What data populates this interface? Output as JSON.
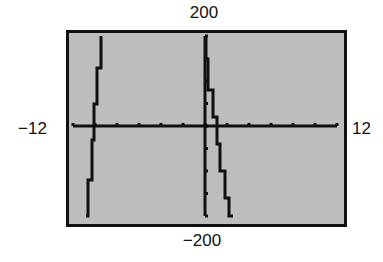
{
  "window": {
    "xmin_label": "−12",
    "xmax_label": "12",
    "ymin_label": "−200",
    "ymax_label": "200"
  },
  "colors": {
    "screen_bg": "#bdbdbd",
    "ink": "#111111",
    "page_bg": "#ffffff"
  },
  "chart_data": {
    "type": "line",
    "title": "",
    "xlabel": "",
    "ylabel": "",
    "xlim": [
      -12,
      12
    ],
    "ylim": [
      -200,
      200
    ],
    "xscl": 2,
    "yscl": 50,
    "grid": false,
    "legend": null,
    "tick_labels": {
      "x": [
        "-12",
        "12"
      ],
      "y": [
        "-200",
        "200"
      ]
    },
    "series": [
      {
        "name": "left branch",
        "points": [
          {
            "x": -9.5,
            "y": 200
          },
          {
            "x": -9.8,
            "y": 130
          },
          {
            "x": -10.1,
            "y": 50
          },
          {
            "x": -10.3,
            "y": -30
          },
          {
            "x": -10.6,
            "y": -120
          },
          {
            "x": -10.8,
            "y": -200
          }
        ]
      },
      {
        "name": "right branch",
        "points": [
          {
            "x": 0.1,
            "y": 200
          },
          {
            "x": 0.3,
            "y": 150
          },
          {
            "x": 0.7,
            "y": 80
          },
          {
            "x": 1.1,
            "y": 20
          },
          {
            "x": 1.4,
            "y": -40
          },
          {
            "x": 1.8,
            "y": -100
          },
          {
            "x": 2.2,
            "y": -160
          },
          {
            "x": 2.5,
            "y": -200
          }
        ]
      }
    ]
  }
}
